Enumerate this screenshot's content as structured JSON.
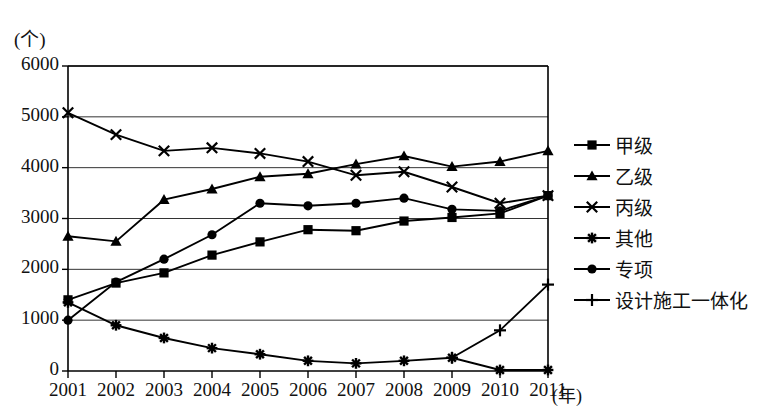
{
  "axes": {
    "y_unit_label": "(个)",
    "x_unit_label": "(年)",
    "y_ticks": [
      "0",
      "1000",
      "2000",
      "3000",
      "4000",
      "5000",
      "6000"
    ],
    "x_ticks": [
      "2001",
      "2002",
      "2003",
      "2004",
      "2005",
      "2006",
      "2007",
      "2008",
      "2009",
      "2010",
      "2011"
    ]
  },
  "legend": {
    "items": [
      {
        "label": "甲级",
        "marker": "square"
      },
      {
        "label": "乙级",
        "marker": "triangle"
      },
      {
        "label": "丙级",
        "marker": "x"
      },
      {
        "label": "其他",
        "marker": "asterisk"
      },
      {
        "label": "专项",
        "marker": "circle"
      },
      {
        "label": "设计施工一体化",
        "marker": "plus"
      }
    ]
  },
  "chart_data": {
    "type": "line",
    "title": "",
    "xlabel": "(年)",
    "ylabel": "(个)",
    "grid": true,
    "legend_position": "right",
    "xlim": [
      2001,
      2011
    ],
    "ylim": [
      0,
      6000
    ],
    "ytick_step": 1000,
    "categories": [
      "2001",
      "2002",
      "2003",
      "2004",
      "2005",
      "2006",
      "2007",
      "2008",
      "2009",
      "2010",
      "2011"
    ],
    "series": [
      {
        "name": "甲级",
        "marker": "square",
        "color": "#000000",
        "values": [
          1400,
          1730,
          1930,
          2280,
          2540,
          2780,
          2760,
          2950,
          3020,
          3100,
          3450
        ]
      },
      {
        "name": "乙级",
        "marker": "triangle",
        "color": "#000000",
        "values": [
          2650,
          2550,
          3370,
          3580,
          3820,
          3880,
          4070,
          4230,
          4020,
          4120,
          4330
        ]
      },
      {
        "name": "丙级",
        "marker": "x",
        "color": "#000000",
        "values": [
          5080,
          4650,
          4330,
          4390,
          4280,
          4120,
          3850,
          3920,
          3620,
          3300,
          3450
        ]
      },
      {
        "name": "其他",
        "marker": "asterisk",
        "color": "#000000",
        "values": [
          1350,
          900,
          650,
          450,
          330,
          200,
          150,
          200,
          260,
          20,
          20
        ]
      },
      {
        "name": "专项",
        "marker": "circle",
        "color": "#000000",
        "values": [
          1000,
          1750,
          2200,
          2680,
          3300,
          3250,
          3300,
          3400,
          3180,
          3150,
          3450
        ]
      },
      {
        "name": "设计施工一体化",
        "marker": "plus",
        "color": "#000000",
        "values": [
          null,
          null,
          null,
          null,
          null,
          null,
          null,
          null,
          260,
          800,
          1700
        ]
      }
    ]
  }
}
